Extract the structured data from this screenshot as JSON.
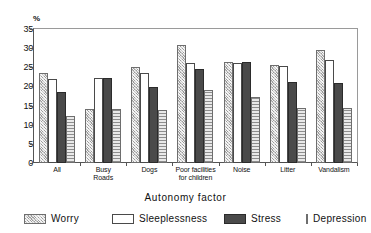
{
  "chart_data": {
    "type": "bar",
    "title": "",
    "xlabel": "Autonomy factor",
    "ylabel": "%",
    "ylim": [
      0,
      35
    ],
    "yticks": [
      0,
      5,
      10,
      15,
      20,
      25,
      30,
      35
    ],
    "grid": false,
    "legend_position": "bottom",
    "categories": [
      "All",
      "Busy Roads",
      "Dogs",
      "Poor facilities for children",
      "Noise",
      "Litter",
      "Vandalism"
    ],
    "category_lines": [
      [
        "All"
      ],
      [
        "Busy",
        "Roads"
      ],
      [
        "Dogs"
      ],
      [
        "Poor facilities",
        "for children"
      ],
      [
        "Noise"
      ],
      [
        "Litter"
      ],
      [
        "Vandalism"
      ]
    ],
    "series": [
      {
        "name": "Worry",
        "pattern": "cross-hatch-light-gray",
        "values": [
          23.4,
          14.2,
          25.0,
          30.7,
          26.5,
          25.5,
          29.6
        ]
      },
      {
        "name": "Sleeplessness",
        "pattern": "white-outline",
        "values": [
          22.0,
          22.2,
          23.5,
          26.2,
          26.0,
          25.4,
          27.0
        ]
      },
      {
        "name": "Stress",
        "pattern": "solid-dark-gray",
        "values": [
          18.5,
          22.3,
          19.9,
          24.6,
          26.3,
          21.2,
          21.0
        ]
      },
      {
        "name": "Depression",
        "pattern": "horizontal-stripes",
        "values": [
          12.4,
          14.2,
          13.8,
          19.0,
          17.2,
          14.3,
          14.5
        ]
      }
    ]
  },
  "colors": {
    "worry": "#c9c9c9",
    "sleeplessness": "#ffffff",
    "stress": "#4a4a4a",
    "depression": "#d4d4d4",
    "axis": "#555555",
    "background": "#ffffff"
  }
}
